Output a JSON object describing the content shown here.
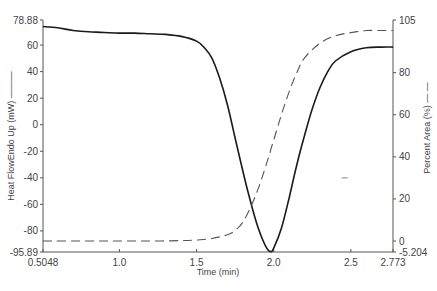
{
  "chart_data": {
    "type": "line",
    "title": "",
    "xlabel": "Time (min)",
    "ylabel_left": "Heat FlowEndo Up (mW)",
    "ylabel_right": "Percent Area (%)",
    "xlim": [
      0.5048,
      2.773
    ],
    "ylim_left": [
      -95.89,
      78.88
    ],
    "ylim_right": [
      -5.204,
      105
    ],
    "x_ticks": [
      "0.5048",
      "1.0",
      "1.5",
      "2.0",
      "2.5",
      "2.773"
    ],
    "y_left_ticks": [
      "78.88",
      "60",
      "40",
      "20",
      "0",
      "-20",
      "-40",
      "-60",
      "-80",
      "-95.89"
    ],
    "y_right_ticks": [
      "105",
      "80",
      "60",
      "40",
      "20",
      "0",
      "-5.204"
    ],
    "grid": false,
    "legend": "none (axis titles carry line-style markers)",
    "series": [
      {
        "name": "Heat Flow Endo Up (mW)",
        "axis": "left",
        "style": "solid",
        "color": "#1a1a1a",
        "x": [
          0.5048,
          0.6,
          0.7,
          0.8,
          0.9,
          1.0,
          1.1,
          1.2,
          1.3,
          1.4,
          1.5,
          1.55,
          1.6,
          1.65,
          1.7,
          1.75,
          1.8,
          1.85,
          1.9,
          1.95,
          1.98,
          2.0,
          2.05,
          2.1,
          2.15,
          2.2,
          2.25,
          2.3,
          2.35,
          2.4,
          2.5,
          2.6,
          2.7,
          2.773
        ],
        "y": [
          74,
          73,
          71,
          70,
          69.5,
          69,
          69,
          68.5,
          68,
          66.5,
          63,
          58,
          50,
          35,
          15,
          -10,
          -35,
          -58,
          -78,
          -92,
          -95.5,
          -93,
          -78,
          -55,
          -30,
          -8,
          12,
          28,
          40,
          48,
          55,
          58,
          58.5,
          58.5
        ]
      },
      {
        "name": "Percent Area (%)",
        "axis": "right",
        "style": "dashed",
        "color": "#555555",
        "x": [
          0.5048,
          0.8,
          1.0,
          1.2,
          1.4,
          1.5,
          1.6,
          1.7,
          1.75,
          1.8,
          1.85,
          1.9,
          1.95,
          2.0,
          2.05,
          2.1,
          2.15,
          2.2,
          2.3,
          2.4,
          2.5,
          2.6,
          2.7,
          2.773
        ],
        "y": [
          0,
          0,
          0,
          0,
          0.2,
          0.5,
          1.2,
          3,
          5,
          9,
          16,
          25,
          36,
          48,
          60,
          71,
          80,
          87,
          94,
          97.5,
          99,
          100,
          100,
          100
        ]
      }
    ],
    "annotations": [
      {
        "type": "short-dash-marker",
        "x": 2.46,
        "y_right": 30
      }
    ]
  }
}
